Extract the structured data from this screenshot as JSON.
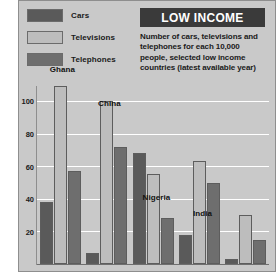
{
  "header": {
    "title": "LOW INCOME",
    "subtitle": "Number of cars, televisions and telephones for each 10,000 people, selected low income countries (latest available year)"
  },
  "legend": {
    "position": "top-left",
    "items": [
      {
        "label": "Cars",
        "color": "#5a5a5a",
        "icon": "legend-swatch-cars"
      },
      {
        "label": "Televisions",
        "color": "#bdbdbd",
        "icon": "legend-swatch-televisions"
      },
      {
        "label": "Telephones",
        "color": "#6e6e6e",
        "icon": "legend-swatch-telephones"
      }
    ]
  },
  "axis": {
    "yticks": [
      "100",
      "80",
      "60",
      "40",
      "20"
    ],
    "ytick_values": [
      100,
      80,
      60,
      40,
      20
    ]
  },
  "colors": {
    "panel": "#c9c9c9",
    "title_bar": "#3a3a3a",
    "gridline": "#ffffff",
    "cars": "#5a5a5a",
    "televisions": "#bdbdbd",
    "telephones": "#6e6e6e"
  },
  "chart_data": {
    "type": "bar",
    "title": "LOW INCOME",
    "subtitle": "Number of cars, televisions and telephones for each 10,000 people, selected low income countries (latest available year)",
    "xlabel": "",
    "ylabel": "",
    "ylim": [
      0,
      100
    ],
    "grid": true,
    "legend_position": "top-left",
    "categories": [
      "Ghana",
      "China",
      "Nigeria",
      "India",
      "Bangladesh"
    ],
    "series": [
      {
        "name": "Cars",
        "color": "#5a5a5a",
        "values": [
          38,
          7,
          68,
          18,
          3
        ]
      },
      {
        "name": "Televisions",
        "color": "#bdbdbd",
        "values": [
          111,
          100,
          55,
          63,
          30
        ]
      },
      {
        "name": "Telephones",
        "color": "#6e6e6e",
        "values": [
          57,
          72,
          28,
          50,
          15
        ]
      }
    ]
  }
}
